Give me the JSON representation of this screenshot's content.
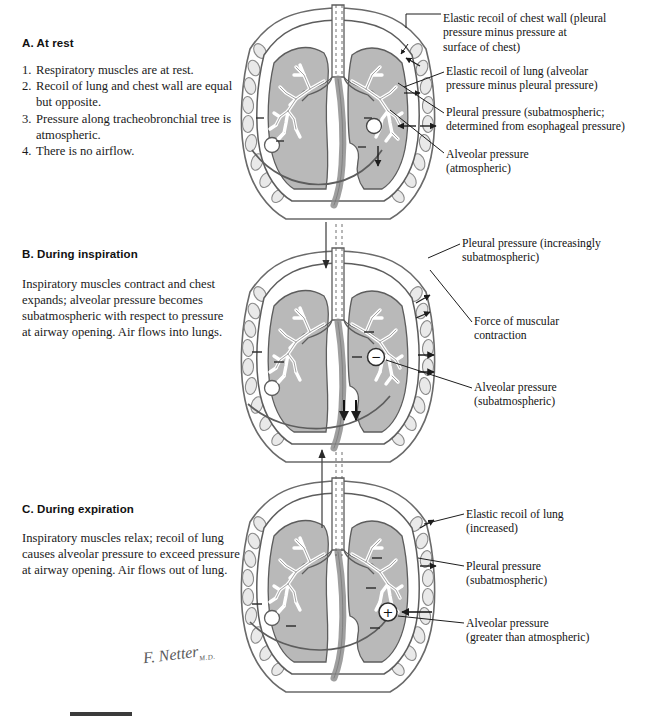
{
  "document": {
    "title": "Mechanics of Breathing",
    "artist_signature": "F. Netter",
    "artist_signature_suffix": "M.D."
  },
  "palette": {
    "lung_fill": "#b9b9b9",
    "lung_fill_light": "#c4c4c4",
    "outline": "#4a4a4a",
    "dark_outline": "#2e2e2e",
    "rib_fill": "#e4e4e4",
    "trachea_fill": "#9a9a9a",
    "text": "#1a1a1a",
    "background": "#ffffff",
    "footer_bar": "#3b3b3b"
  },
  "panels": [
    {
      "id": "a",
      "heading": "A. At rest",
      "list": [
        {
          "num": "1.",
          "text": "Respiratory muscles are at rest."
        },
        {
          "num": "2.",
          "text": "Recoil of lung and chest wall are equal but opposite."
        },
        {
          "num": "3.",
          "text": "Pressure along tracheobronchial tree is atmospheric."
        },
        {
          "num": "4.",
          "text": "There is no airflow."
        }
      ],
      "alveolus_sign": "",
      "airflow": "none",
      "callouts": [
        {
          "name": "elastic-recoil-chest-wall",
          "line1": "Elastic recoil of chest wall (pleural",
          "line2": "pressure minus pressure at",
          "line3": "surface of chest)"
        },
        {
          "name": "elastic-recoil-lung",
          "line1": "Elastic recoil of lung (alveolar",
          "line2": "pressure minus pleural pressure)",
          "line3": ""
        },
        {
          "name": "pleural-pressure",
          "line1": "Pleural pressure (subatmospheric;",
          "line2": "determined from esophageal pressure)",
          "line3": ""
        },
        {
          "name": "alveolar-pressure",
          "line1": "Alveolar pressure",
          "line2": "(atmospheric)",
          "line3": ""
        }
      ]
    },
    {
      "id": "b",
      "heading": "B. During inspiration",
      "body": "Inspiratory muscles contract and chest expands; alveolar pressure becomes subatmospheric with respect to pressure at airway opening. Air flows into lungs.",
      "alveolus_sign": "−",
      "airflow": "in",
      "callouts": [
        {
          "name": "pleural-pressure-inspiration",
          "line1": "Pleural pressure (increasingly",
          "line2": "subatmospheric)",
          "line3": ""
        },
        {
          "name": "force-of-muscular-contraction",
          "line1": "Force of muscular",
          "line2": "contraction",
          "line3": ""
        },
        {
          "name": "alveolar-pressure-inspiration",
          "line1": "Alveolar pressure",
          "line2": "(subatmospheric)",
          "line3": ""
        }
      ]
    },
    {
      "id": "c",
      "heading": "C. During expiration",
      "body": "Inspiratory muscles relax; recoil of lung causes alveolar pressure to exceed pressure at airway opening. Air flows out of lung.",
      "alveolus_sign": "+",
      "airflow": "out",
      "callouts": [
        {
          "name": "elastic-recoil-lung-expiration",
          "line1": "Elastic recoil of lung",
          "line2": "(increased)",
          "line3": ""
        },
        {
          "name": "pleural-pressure-expiration",
          "line1": "Pleural pressure",
          "line2": "(subatmospheric)",
          "line3": ""
        },
        {
          "name": "alveolar-pressure-expiration",
          "line1": "Alveolar pressure",
          "line2": "(greater than atmospheric)",
          "line3": ""
        }
      ]
    }
  ]
}
